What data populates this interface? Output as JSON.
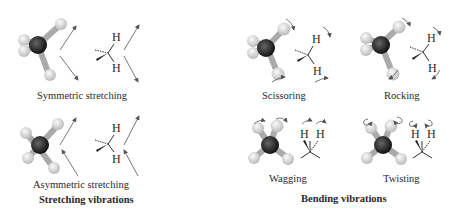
{
  "panels": {
    "stretching": {
      "title": "Stretching vibrations",
      "modes": [
        {
          "label": "Symmetric stretching"
        },
        {
          "label": "Asymmetric stretching"
        }
      ]
    },
    "bending": {
      "title": "Bending vibrations",
      "modes": [
        {
          "label": "Scissoring"
        },
        {
          "label": "Rocking"
        },
        {
          "label": "Wagging"
        },
        {
          "label": "Twisting"
        }
      ]
    }
  },
  "atom_label": "H",
  "colors": {
    "carbon": "#222222",
    "hydrogen": "#e8e8e8",
    "arrow": "#555555"
  }
}
